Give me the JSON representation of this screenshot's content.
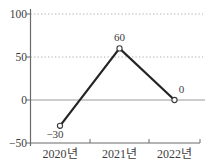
{
  "chart_data": {
    "type": "line",
    "title": "",
    "xlabel": "",
    "ylabel": "",
    "categories": [
      "2020년",
      "2021년",
      "2022년"
    ],
    "series": [
      {
        "name": "value-by-year",
        "values": [
          -30,
          60,
          0
        ]
      }
    ],
    "point_labels": [
      "−30",
      "60",
      "0"
    ],
    "yticks": [
      100,
      50,
      0,
      -50
    ],
    "ytick_labels": [
      "100",
      "50",
      "0",
      "−50"
    ],
    "ylim": [
      -50,
      100
    ],
    "dotted_gridlines": [
      100,
      50
    ],
    "zero_line": true,
    "grid": "horizontal dotted at 50 and 100, solid thin line at 0",
    "legend_position": "none",
    "marker": "open-circle",
    "colors": {
      "line": "#242424",
      "marker_fill": "#ffffff",
      "marker_stroke": "#3a3a3a",
      "axis": "#6a6a6a",
      "gridline": "#b0b0b0",
      "zero_line": "#9a9a9a",
      "text": "#3d3d3d",
      "background": "#ffffff"
    }
  }
}
